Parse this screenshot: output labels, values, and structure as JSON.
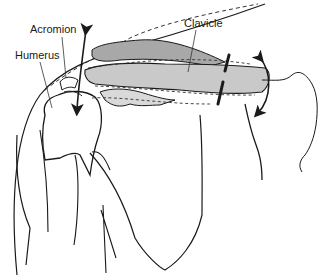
{
  "figure": {
    "labels": {
      "acromion": "Acromion",
      "humerus": "Humerus",
      "clavicle": "Clavicle"
    },
    "colors": {
      "line": "#1a1a1a",
      "bone_fill": "#bdbdbd",
      "bone_fill_light": "#d9d9d9",
      "background": "#ffffff"
    }
  }
}
